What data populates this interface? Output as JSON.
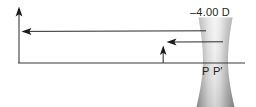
{
  "figure": {
    "width": 256,
    "height": 107,
    "background_color": "#ffffff",
    "line_color": "#231f20",
    "lens_fill_dark": "#8d8d8d",
    "lens_fill_light": "#f2f2f2"
  },
  "labels": {
    "power": "–4.00 D",
    "principal_point": "P",
    "principal_point_prime": "P′"
  },
  "optics": {
    "lens_type": "biconcave-diverging",
    "lens_power_diopters": -4.0,
    "axis": {
      "y": 63,
      "x_start": 18,
      "x_end": 245
    },
    "object_arrow": {
      "x": 19,
      "y_base": 63,
      "y_tip": 8,
      "direction": "up"
    },
    "image_arrow": {
      "x": 163,
      "y_base": 63,
      "y_tip": 47,
      "direction": "up"
    },
    "rays": [
      {
        "name": "upper-ray",
        "y": 31,
        "x_from": 205,
        "x_to": 24,
        "arrow": "left"
      },
      {
        "name": "lower-ray",
        "y": 42,
        "x_from": 222,
        "x_to": 166,
        "arrow": "left"
      }
    ],
    "lens_geometry": {
      "x_left_top": 198,
      "x_right_top": 233,
      "x_left_waist": 203,
      "x_right_waist": 228,
      "y_top": 18,
      "y_bottom": 107
    }
  }
}
